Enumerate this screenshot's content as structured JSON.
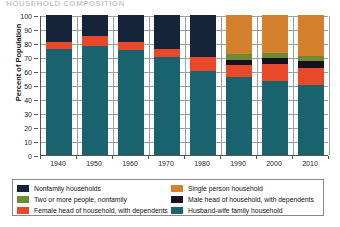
{
  "ghost_header": "HOUSEHOLD COMPOSITION",
  "chart_data": {
    "type": "bar",
    "stacked": true,
    "title": "",
    "xlabel": "",
    "ylabel": "Percent of Population",
    "ylim": [
      0,
      100
    ],
    "ytick_step": 10,
    "yticks": [
      0,
      10,
      20,
      30,
      40,
      50,
      60,
      70,
      80,
      90,
      100
    ],
    "grid": true,
    "legend_position": "bottom",
    "categories": [
      "1940",
      "1950",
      "1960",
      "1970",
      "1980",
      "1990",
      "2000",
      "2010"
    ],
    "series": [
      {
        "name": "Husband-wife family household",
        "color": "#1a6470",
        "values": [
          76,
          78,
          75,
          70,
          60,
          56,
          53,
          50
        ]
      },
      {
        "name": "Female head of household, with dependents",
        "color": "#e8492a",
        "values": [
          5,
          7,
          6,
          6,
          10,
          8,
          12,
          12
        ]
      },
      {
        "name": "Male head of household, with dependents",
        "color": "#1a0f1e",
        "values": [
          0,
          0,
          0,
          0,
          0,
          4,
          4,
          5
        ]
      },
      {
        "name": "Two or more people, nonfamily",
        "color": "#6b8c35",
        "values": [
          0,
          0,
          0,
          0,
          0,
          4,
          4,
          4
        ]
      },
      {
        "name": "Nonfamily households",
        "color": "#16243a",
        "values": [
          19,
          15,
          19,
          24,
          30,
          0,
          0,
          0
        ]
      },
      {
        "name": "Single person household",
        "color": "#d4812e",
        "values": [
          0,
          0,
          0,
          0,
          0,
          28,
          27,
          29
        ]
      }
    ],
    "stack_order": [
      "Husband-wife family household",
      "Female head of household, with dependents",
      "Male head of household, with dependents",
      "Two or more people, nonfamily",
      "Nonfamily households",
      "Single person household"
    ]
  },
  "legend": {
    "left_column": [
      {
        "label": "Nonfamily households",
        "color": "#16243a"
      },
      {
        "label": "Two or more people, nonfamily",
        "color": "#6b8c35"
      },
      {
        "label": "Female head of household, with dependents",
        "color": "#e8492a"
      }
    ],
    "right_column": [
      {
        "label": "Single person household",
        "color": "#d4812e"
      },
      {
        "label": "Male head of household, with dependents",
        "color": "#1a0f1e"
      },
      {
        "label": "Husband-wife family household",
        "color": "#1a6470"
      }
    ]
  }
}
